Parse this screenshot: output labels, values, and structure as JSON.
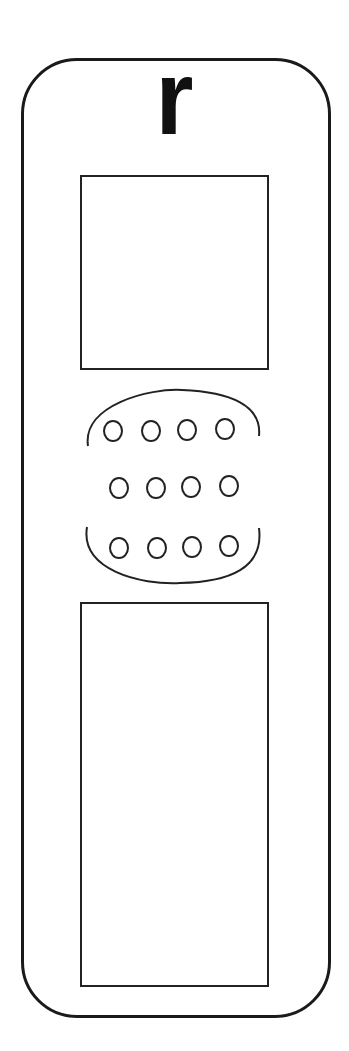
{
  "card": {
    "letter": "r",
    "boxes": [
      {
        "name": "top-box"
      },
      {
        "name": "middle-box"
      },
      {
        "name": "bottom-box"
      }
    ],
    "dot_grid": {
      "rows": 3,
      "columns": 4,
      "dots_total": 12
    }
  },
  "colors": {
    "stroke": "#1a1a1a",
    "background": "#ffffff"
  }
}
